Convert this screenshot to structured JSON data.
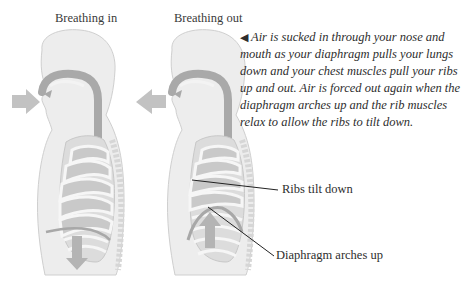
{
  "titles": {
    "left": "Breathing in",
    "right": "Breathing out"
  },
  "caption": {
    "marker": "◀",
    "text": "Air is sucked in through your nose and mouth as your diaphragm pulls your lungs down and your chest muscles pull your ribs up and out. Air is forced out again when the diaphragm arches up and the rib muscles relax to allow the ribs to tilt down."
  },
  "labels": {
    "ribs": "Ribs tilt down",
    "diaphragm": "Diaphragm arches up"
  },
  "colors": {
    "body_fill": "#ececec",
    "airway": "#a8a8a8",
    "lung": "#c9c9c9",
    "rib": "#f7f7f7",
    "arrow": "#b4b4b4",
    "outline": "#c8c8c8",
    "leader_line": "#222222"
  }
}
